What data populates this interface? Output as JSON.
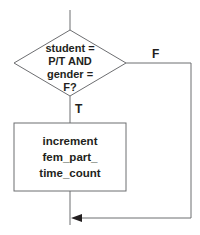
{
  "diagram": {
    "type": "flowchart",
    "decision": {
      "lines": [
        "student =",
        "P/T AND",
        "gender =",
        "F?"
      ]
    },
    "branches": {
      "true_label": "T",
      "false_label": "F"
    },
    "process": {
      "lines": [
        "increment",
        "fem_part_",
        "time_count"
      ]
    },
    "colors": {
      "stroke": "#6d6e71",
      "text": "#231f20",
      "background": "#ffffff"
    }
  }
}
